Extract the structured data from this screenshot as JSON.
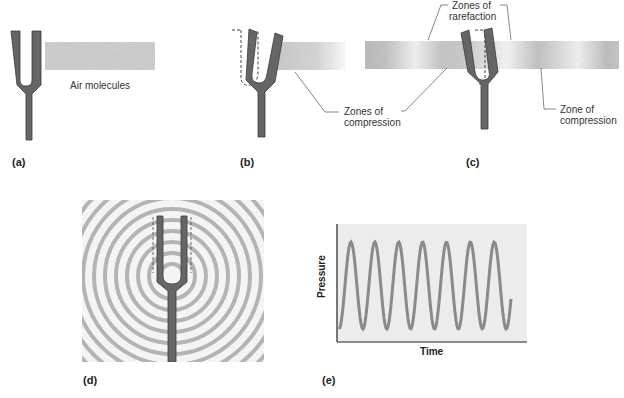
{
  "panels": {
    "a": {
      "label": "(a)",
      "air_label": "Air molecules"
    },
    "b": {
      "label": "(b)",
      "callout": [
        "Zones of",
        "compression"
      ]
    },
    "c": {
      "label": "(c)",
      "callout_top": [
        "Zones of",
        "rarefaction"
      ],
      "callout_right": [
        "Zone of",
        "compression"
      ]
    },
    "d": {
      "label": "(d)"
    },
    "e": {
      "label": "(e)"
    }
  },
  "colors": {
    "fork": "#666666",
    "fork_edge": "#3a3a3a",
    "air": "#b8b8b8",
    "wave": "#8a8a8a",
    "plot_bg": "#ececec"
  },
  "chart_data": {
    "type": "line",
    "title": "",
    "xlabel": "Time",
    "ylabel": "Pressure",
    "cycles": 7,
    "grid": false,
    "series": [
      {
        "name": "pressure",
        "shape": "sine",
        "peaks": 7,
        "troughs": 8
      }
    ]
  }
}
